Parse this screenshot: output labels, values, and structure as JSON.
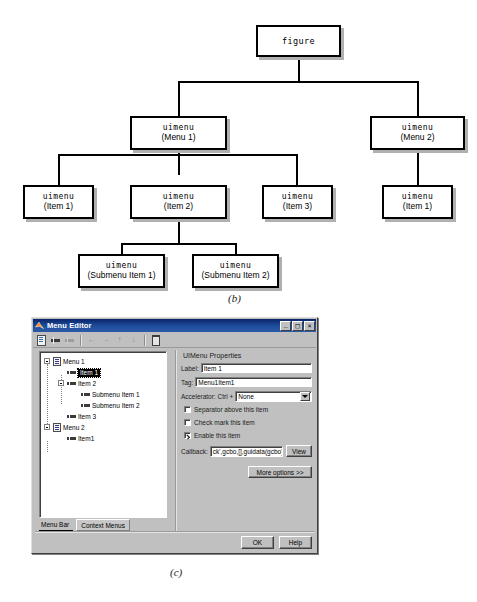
{
  "figure_b": {
    "caption": "(b)",
    "nodes": [
      {
        "id": "figure",
        "type": "figure",
        "label": ""
      },
      {
        "id": "menu1",
        "type": "uimenu",
        "label": "(Menu 1)"
      },
      {
        "id": "menu2",
        "type": "uimenu",
        "label": "(Menu 2)"
      },
      {
        "id": "item1",
        "type": "uimenu",
        "label": "(Item 1)"
      },
      {
        "id": "item2",
        "type": "uimenu",
        "label": "(Item 2)"
      },
      {
        "id": "item3",
        "type": "uimenu",
        "label": "(Item 3)"
      },
      {
        "id": "m2item1",
        "type": "uimenu",
        "label": "(Item 1)"
      },
      {
        "id": "sub1",
        "type": "uimenu",
        "label": "(Submenu Item 1)"
      },
      {
        "id": "sub2",
        "type": "uimenu",
        "label": "(Submenu Item 2)"
      }
    ],
    "type_figure": "figure",
    "type_uimenu": "uimenu"
  },
  "figure_c": {
    "caption": "(c)",
    "window": {
      "title": "Menu Editor",
      "icon": "matlab-icon",
      "minimize_label": "_",
      "maximize_label": "□",
      "close_label": "×"
    },
    "toolbar": {
      "items": [
        {
          "name": "new-menu-button",
          "icon": "new-menu-icon",
          "enabled": true
        },
        {
          "name": "new-menu-item-button",
          "icon": "new-menu-item-icon",
          "enabled": true
        },
        {
          "name": "new-context-menu-button",
          "icon": "new-context-menu-icon",
          "enabled": false
        },
        {
          "name": "move-left-button",
          "icon": "arrow-left-icon",
          "enabled": false
        },
        {
          "name": "move-right-button",
          "icon": "arrow-right-icon",
          "enabled": false
        },
        {
          "name": "move-up-button",
          "icon": "arrow-up-icon",
          "enabled": false
        },
        {
          "name": "move-down-button",
          "icon": "arrow-down-icon",
          "enabled": false
        },
        {
          "name": "delete-button",
          "icon": "trash-icon",
          "enabled": true
        }
      ],
      "glyphs": {
        "arrow_left": "←",
        "arrow_right": "→",
        "arrow_up": "↑",
        "arrow_down": "↓"
      }
    },
    "tree": {
      "rows": [
        {
          "label": "Menu 1",
          "depth": 0,
          "icon": "menu-icon",
          "expander": true,
          "selected": false
        },
        {
          "label": "Item 1",
          "depth": 1,
          "icon": "menu-item-icon",
          "expander": false,
          "selected": true
        },
        {
          "label": "Item 2",
          "depth": 1,
          "icon": "menu-item-icon",
          "expander": true,
          "selected": false
        },
        {
          "label": "Submenu Item 1",
          "depth": 2,
          "icon": "menu-item-icon",
          "expander": false,
          "selected": false
        },
        {
          "label": "Submenu Item 2",
          "depth": 2,
          "icon": "menu-item-icon",
          "expander": false,
          "selected": false
        },
        {
          "label": "Item 3",
          "depth": 1,
          "icon": "menu-item-icon",
          "expander": false,
          "selected": false
        },
        {
          "label": "Menu 2",
          "depth": 0,
          "icon": "menu-icon",
          "expander": true,
          "selected": false
        },
        {
          "label": "Item1",
          "depth": 1,
          "icon": "menu-item-icon",
          "expander": false,
          "selected": false
        }
      ]
    },
    "tabs": [
      {
        "label": "Menu Bar",
        "active": true
      },
      {
        "label": "Context Menus",
        "active": false
      }
    ],
    "properties": {
      "title": "UIMenu Properties",
      "label_label": "Label:",
      "label_value": "Item 1",
      "tag_label": "Tag:",
      "tag_value": "Menu1Item1",
      "accelerator_label": "Accelerator: Ctrl +",
      "accelerator_value": "None",
      "separator_label": "Separator above this item",
      "separator_checked": false,
      "checkmark_label": "Check mark this item",
      "checkmark_checked": false,
      "enable_label": "Enable this item",
      "enable_checked": true,
      "callback_label": "Callback:",
      "callback_value": "ck',gcbo,[],guidata(gcbo))",
      "view_button": "View",
      "more_options_button": "More options >>"
    },
    "footer": {
      "ok_button": "OK",
      "help_button": "Help"
    }
  }
}
